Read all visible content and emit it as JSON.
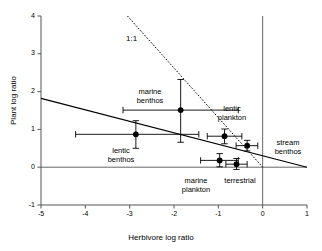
{
  "chart_data": {
    "type": "scatter",
    "title": "",
    "xlabel": "Herbivore log ratio",
    "ylabel": "Plant log ratio",
    "xlim": [
      -5,
      1
    ],
    "ylim": [
      -1,
      4
    ],
    "xticks": [
      -5,
      -4,
      -3,
      -2,
      -1,
      0,
      1
    ],
    "xticklabels": [
      "-5",
      "-4",
      "-3",
      "-2",
      "-1",
      "0",
      "1"
    ],
    "yticks": [
      -1,
      0,
      1,
      2,
      3,
      4
    ],
    "yticklabels": [
      "-1",
      "0",
      "1",
      "2",
      "3",
      "4"
    ],
    "grid": false,
    "legend": "none",
    "marker": "filled-circle",
    "points": [
      {
        "label": "marine benthos",
        "x": -1.85,
        "y": 1.51,
        "xerr_low": -3.15,
        "xerr_high": -0.55,
        "yerr_low": 0.66,
        "yerr_high": 2.32,
        "label_x": 150,
        "label_y": 88,
        "label_align": "center"
      },
      {
        "label": "lentic benthos",
        "x": -2.86,
        "y": 0.87,
        "xerr_low": -4.22,
        "xerr_high": -1.44,
        "yerr_low": 0.5,
        "yerr_high": 1.23,
        "label_x": 121,
        "label_y": 147,
        "label_align": "center"
      },
      {
        "label": "lentic plankton",
        "x": -0.86,
        "y": 0.82,
        "xerr_low": -1.25,
        "xerr_high": -0.47,
        "yerr_low": 0.62,
        "yerr_high": 1.01,
        "label_x": 232,
        "label_y": 105,
        "label_align": "center"
      },
      {
        "label": "stream benthos",
        "x": -0.35,
        "y": 0.57,
        "xerr_low": -0.6,
        "xerr_high": -0.11,
        "yerr_low": 0.43,
        "yerr_high": 0.71,
        "label_x": 288,
        "label_y": 139,
        "label_align": "center"
      },
      {
        "label": "marine plankton",
        "x": -0.97,
        "y": 0.18,
        "xerr_low": -1.4,
        "xerr_high": -0.55,
        "yerr_low": 0.01,
        "yerr_high": 0.36,
        "label_x": 196,
        "label_y": 177,
        "label_align": "center"
      },
      {
        "label": "terrestrial",
        "x": -0.59,
        "y": 0.08,
        "xerr_low": -0.83,
        "xerr_high": -0.35,
        "yerr_low": -0.06,
        "yerr_high": 0.23,
        "label_x": 240,
        "label_y": 177,
        "label_align": "center"
      }
    ],
    "lines": [
      {
        "name": "one-to-one-line",
        "style": "dotted",
        "label": "1:1",
        "label_x": 126,
        "label_y": 34,
        "x1": -3.05,
        "y1": 4.0,
        "x2": 0.0,
        "y2": 0.0
      },
      {
        "name": "regression-line",
        "style": "solid",
        "label": "",
        "x1": -5.0,
        "y1": 1.82,
        "x2": 1.0,
        "y2": 0.0
      }
    ],
    "reference_lines": [
      {
        "name": "zero-horizontal",
        "orientation": "horizontal",
        "value": 0
      },
      {
        "name": "zero-vertical",
        "orientation": "vertical",
        "value": 0
      }
    ]
  }
}
